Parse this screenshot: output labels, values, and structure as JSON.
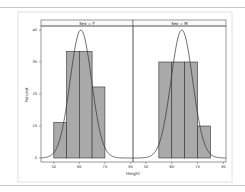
{
  "chart_data": {
    "type": "bar",
    "title": "",
    "xlabel": "Height",
    "ylabel": "Percent",
    "ylim": [
      0,
      40
    ],
    "yticks": [
      0,
      10,
      20,
      30,
      40
    ],
    "grid": false,
    "legend": "none",
    "panels": [
      {
        "label": "Sex = F",
        "xticks": [
          50,
          60,
          70,
          80
        ],
        "xlim": [
          45,
          81
        ],
        "bin_edges": [
          50,
          55,
          60,
          65,
          70
        ],
        "values": [
          11.1,
          33.3,
          33.3,
          22.2
        ],
        "normal_curve": {
          "mean": 60.6,
          "peak_percent": 40
        }
      },
      {
        "label": "Sex = M",
        "xticks": [
          50,
          60,
          70,
          80
        ],
        "xlim": [
          45,
          81
        ],
        "bin_edges": [
          55,
          60,
          65,
          70,
          75
        ],
        "values": [
          30,
          30,
          30,
          10
        ],
        "normal_curve": {
          "mean": 63.9,
          "peak_percent": 40
        }
      }
    ]
  }
}
